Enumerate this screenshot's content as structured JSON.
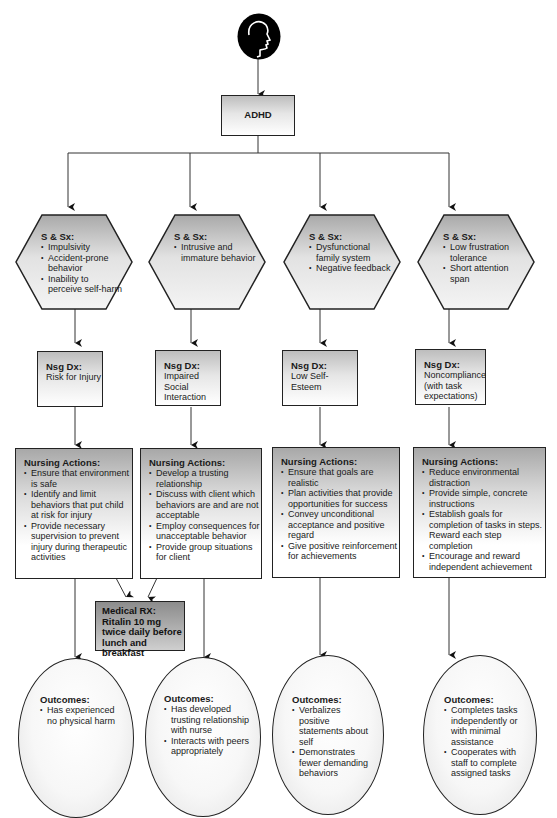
{
  "diagram": {
    "root": {
      "icon": "head-profile-icon",
      "label": "ADHD"
    },
    "columns": [
      {
        "signs_symptoms": {
          "title": "S & Sx:",
          "items": [
            "Impulsivity",
            "Accident-prone behavior",
            "Inability to perceive self-harm"
          ]
        },
        "nursing_dx": {
          "title": "Nsg Dx:",
          "text": "Risk for Injury"
        },
        "nursing_actions": {
          "title": "Nursing Actions:",
          "items": [
            "Ensure that environment is safe",
            "Identify and limit behaviors that put child at risk for injury",
            "Provide necessary supervision to prevent injury during therapeutic activities"
          ]
        },
        "outcomes": {
          "title": "Outcomes:",
          "items": [
            "Has experienced no physical harm"
          ]
        }
      },
      {
        "signs_symptoms": {
          "title": "S & Sx:",
          "items": [
            "Intrusive and immature behavior"
          ]
        },
        "nursing_dx": {
          "title": "Nsg Dx:",
          "text": "Impaired Social Interaction"
        },
        "nursing_actions": {
          "title": "Nursing Actions:",
          "items": [
            "Develop a trusting relationship",
            "Discuss with client which behaviors are and are not acceptable",
            "Employ consequences for unacceptable behavior",
            "Provide group situations for client"
          ]
        },
        "outcomes": {
          "title": "Outcomes:",
          "items": [
            "Has developed trusting relationship with nurse",
            "Interacts with peers appropriately"
          ]
        }
      },
      {
        "signs_symptoms": {
          "title": "S & Sx:",
          "items": [
            "Dysfunctional family system",
            "Negative feedback"
          ]
        },
        "nursing_dx": {
          "title": "Nsg Dx:",
          "text": "Low Self-Esteem"
        },
        "nursing_actions": {
          "title": "Nursing Actions:",
          "items": [
            "Ensure that goals are realistic",
            "Plan activities that provide opportunities for success",
            "Convey unconditional acceptance and positive regard",
            "Give positive reinforcement for achievements"
          ]
        },
        "outcomes": {
          "title": "Outcomes:",
          "items": [
            "Verbalizes positive statements about self",
            "Demonstrates fewer demanding behaviors"
          ]
        }
      },
      {
        "signs_symptoms": {
          "title": "S & Sx:",
          "items": [
            "Low frustration tolerance",
            "Short attention span"
          ]
        },
        "nursing_dx": {
          "title": "Nsg Dx:",
          "text": "Noncompliance (with task expectations)"
        },
        "nursing_actions": {
          "title": "Nursing Actions:",
          "items": [
            "Reduce environmental distraction",
            "Provide simple, concrete instructions",
            "Establish goals for completion of tasks in steps. Reward each step completion",
            "Encourage and reward independent achievement"
          ]
        },
        "outcomes": {
          "title": "Outcomes:",
          "items": [
            "Completes tasks independently or with minimal assistance",
            "Cooperates with staff to complete assigned tasks"
          ]
        }
      }
    ],
    "medical_rx": {
      "title": "Medical RX:",
      "text": "Ritalin 10 mg twice daily before lunch and breakfast"
    }
  }
}
